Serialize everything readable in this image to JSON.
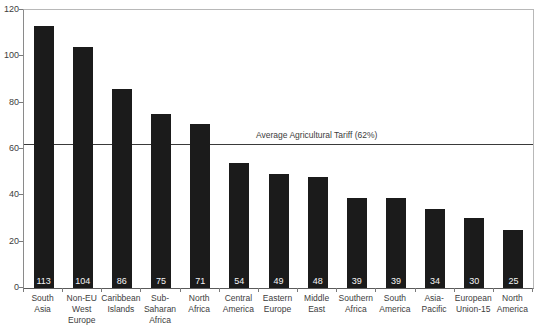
{
  "chart_data": {
    "type": "bar",
    "title": "",
    "xlabel": "",
    "ylabel": "",
    "categories": [
      "South\nAsia",
      "Non-EU\nWest\nEurope",
      "Caribbean\nIslands",
      "Sub-\nSaharan\nAfrica",
      "North\nAfrica",
      "Central\nAmerica",
      "Eastern\nEurope",
      "Middle\nEast",
      "Southern\nAfrica",
      "South\nAmerica",
      "Asia-\nPacific",
      "European\nUnion-15",
      "North\nAmerica"
    ],
    "values": [
      113,
      104,
      86,
      75,
      71,
      54,
      49,
      48,
      39,
      39,
      34,
      30,
      25
    ],
    "bar_labels": [
      "113",
      "104",
      "86",
      "75",
      "71",
      "54",
      "49",
      "48",
      "39",
      "39",
      "34",
      "30",
      "25"
    ],
    "ylim": [
      0,
      120
    ],
    "yticks": [
      0,
      20,
      40,
      60,
      80,
      100,
      120
    ],
    "reference_line": {
      "value": 62,
      "label": "Average Agricultural Tariff (62%)"
    },
    "grid": false,
    "legend": false,
    "colors": {
      "bar": "#1b1b1b",
      "bar_label": "#f5f5f5",
      "axis": "#8a8a8a",
      "frame": "#b8b8b8",
      "text": "#3d3d3d",
      "reference_line": "#3a3a3a",
      "background": "#ffffff"
    }
  }
}
